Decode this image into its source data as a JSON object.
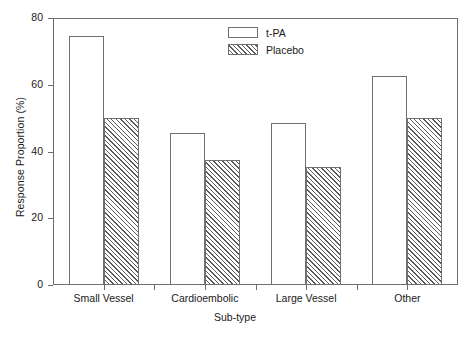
{
  "chart_data": {
    "type": "bar",
    "title": "",
    "xlabel": "Sub-type",
    "ylabel": "Response Proportion (%)",
    "categories": [
      "Small Vessel",
      "Cardioembolic",
      "Large Vessel",
      "Other"
    ],
    "series": [
      {
        "name": "t-PA",
        "values": [
          74.5,
          45.5,
          48.5,
          62.5
        ],
        "fill": "solid-white"
      },
      {
        "name": "Placebo",
        "values": [
          50.0,
          37.5,
          35.5,
          50.0
        ],
        "fill": "diagonal-hatch"
      }
    ],
    "ylim": [
      0,
      80
    ],
    "yticks": [
      0,
      20,
      40,
      60,
      80
    ],
    "yticklabels": [
      "0",
      "20",
      "40",
      "60",
      "80"
    ],
    "grid": false,
    "legend_position": "top-center",
    "frame": true,
    "colors": {
      "axis": "#6d6d6d",
      "bar_edge": "#707070",
      "hatch": "#5c5c5c",
      "background": "#ffffff",
      "text": "#1a1a1a"
    }
  },
  "legend": {
    "entries": [
      {
        "label": "t-PA"
      },
      {
        "label": "Placebo"
      }
    ]
  }
}
